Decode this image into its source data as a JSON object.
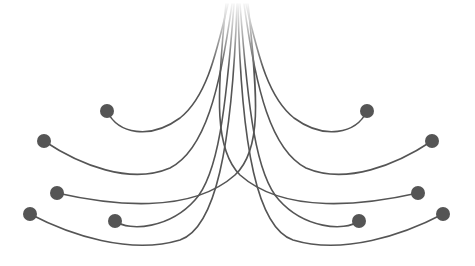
{
  "diagram": {
    "width": 475,
    "height": 266,
    "background": "#ffffff",
    "stroke_color": "#555555",
    "dot_color": "#555555",
    "stroke_width": 1.6,
    "dot_radius": 7,
    "fade_top": 0,
    "fade_bottom": 70,
    "curves": [
      {
        "side": "left",
        "d": "M107,111 C118,134 150,140 180,118 C205,98 215,60 228,4",
        "dot": [
          107,
          111
        ]
      },
      {
        "side": "left",
        "d": "M44,141 C80,165 130,185 170,168 C205,150 220,90 232,4",
        "dot": [
          44,
          141
        ]
      },
      {
        "side": "left",
        "d": "M57,193 C110,205 190,215 235,175 C262,150 258,100 248,4",
        "dot": [
          57,
          193
        ]
      },
      {
        "side": "left",
        "d": "M30,214 C70,235 130,255 180,240 C215,228 232,150 237,4",
        "dot": [
          30,
          214
        ]
      },
      {
        "side": "left",
        "d": "M115,221 C130,232 170,228 195,200 C218,175 226,110 234,4",
        "dot": [
          115,
          221
        ]
      },
      {
        "side": "right",
        "d": "M367,111 C356,134 324,140 294,118 C269,98 259,60 246,4",
        "dot": [
          367,
          111
        ]
      },
      {
        "side": "right",
        "d": "M432,141 C396,165 346,185 306,168 C271,150 256,90 244,4",
        "dot": [
          432,
          141
        ]
      },
      {
        "side": "right",
        "d": "M418,193 C365,205 285,215 240,175 C215,150 216,100 226,4",
        "dot": [
          418,
          193
        ]
      },
      {
        "side": "right",
        "d": "M443,214 C403,235 343,255 293,240 C258,228 241,150 238,4",
        "dot": [
          443,
          214
        ]
      },
      {
        "side": "right",
        "d": "M359,221 C344,232 304,228 279,200 C256,175 248,110 240,4",
        "dot": [
          359,
          221
        ]
      }
    ]
  }
}
